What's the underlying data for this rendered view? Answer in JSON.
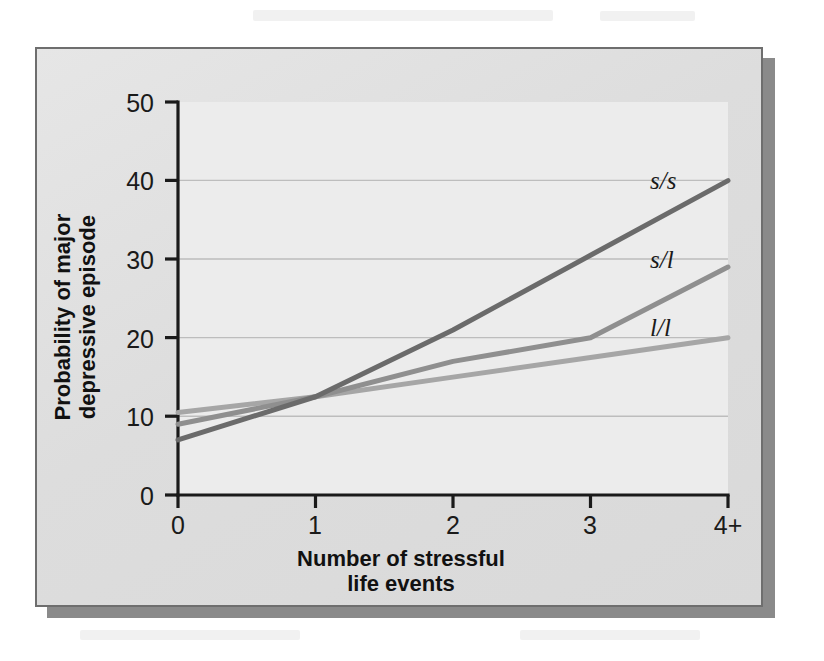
{
  "figure": {
    "plate_bg": "#dddddd",
    "border_color": "#6e6e6e",
    "shadow_color": "#8a8a8a"
  },
  "axis": {
    "y_ticks": [
      "0",
      "10",
      "20",
      "30",
      "40",
      "50"
    ],
    "x_ticks": [
      "0",
      "1",
      "2",
      "3",
      "4+"
    ],
    "y_title_line1": "Probability of major",
    "y_title_line2": "depressive episode",
    "x_title_line1": "Number of stressful",
    "x_title_line2": "life events"
  },
  "series_labels": {
    "ss": "s/s",
    "sl": "s/l",
    "ll": "l/l"
  },
  "chart_data": {
    "type": "line",
    "title": "",
    "subtitle": "",
    "xlabel": "Number of stressful life events",
    "ylabel": "Probability of major depressive episode",
    "x": [
      "0",
      "1",
      "2",
      "3",
      "4+"
    ],
    "x_numeric": [
      0,
      1,
      2,
      3,
      4
    ],
    "xlim": [
      0,
      4
    ],
    "ylim": [
      0,
      50
    ],
    "y_ticks": [
      0,
      10,
      20,
      30,
      40,
      50
    ],
    "x_ticks": [
      0,
      1,
      2,
      3,
      4
    ],
    "grid": "horizontal-at-10-20-30-40",
    "legend_position": "line-end-labels-right",
    "series": [
      {
        "name": "s/s",
        "label": "s/s",
        "color": "#6b6b6b",
        "width": 5,
        "values": [
          7,
          12.5,
          21,
          30.5,
          40
        ]
      },
      {
        "name": "s/l",
        "label": "s/l",
        "color": "#8f8f8f",
        "width": 5,
        "values": [
          9,
          12.5,
          17,
          20,
          29
        ]
      },
      {
        "name": "l/l",
        "label": "l/l",
        "color": "#a6a6a6",
        "width": 5,
        "values": [
          10.5,
          12.5,
          15,
          17.5,
          20
        ]
      }
    ]
  }
}
